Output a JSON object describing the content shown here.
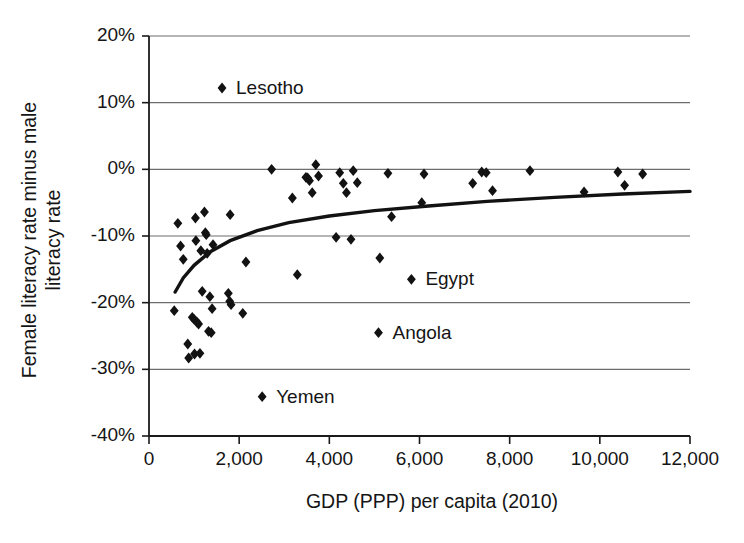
{
  "chart_data": {
    "type": "scatter",
    "title": "",
    "xlabel": "GDP (PPP) per capita (2010)",
    "ylabel_line1": "Female literacy rate minus male",
    "ylabel_line2": "literacy rate",
    "xlim": [
      0,
      12000
    ],
    "ylim": [
      -0.4,
      0.2
    ],
    "grid": "horizontal",
    "legend": "none",
    "xticks": [
      0,
      2000,
      4000,
      6000,
      8000,
      10000,
      12000
    ],
    "xticklabels": [
      "0",
      "2,000",
      "4,000",
      "6,000",
      "8,000",
      "10,000",
      "12,000"
    ],
    "yticks": [
      0.2,
      0.1,
      0.0,
      -0.1,
      -0.2,
      -0.3,
      -0.4
    ],
    "yticklabels": [
      "20%",
      "10%",
      "0%",
      "-10%",
      "-20%",
      "-30%",
      "-40%"
    ],
    "marker": "diamond",
    "marker_color": "#121212",
    "points": [
      {
        "x": 560,
        "y": -0.212
      },
      {
        "x": 640,
        "y": -0.081
      },
      {
        "x": 700,
        "y": -0.115
      },
      {
        "x": 760,
        "y": -0.135
      },
      {
        "x": 860,
        "y": -0.262
      },
      {
        "x": 880,
        "y": -0.283
      },
      {
        "x": 960,
        "y": -0.222
      },
      {
        "x": 1000,
        "y": -0.225
      },
      {
        "x": 1010,
        "y": -0.277
      },
      {
        "x": 1030,
        "y": -0.073
      },
      {
        "x": 1040,
        "y": -0.107
      },
      {
        "x": 1060,
        "y": -0.229
      },
      {
        "x": 1100,
        "y": -0.232
      },
      {
        "x": 1130,
        "y": -0.276
      },
      {
        "x": 1150,
        "y": -0.122
      },
      {
        "x": 1180,
        "y": -0.183
      },
      {
        "x": 1230,
        "y": -0.064
      },
      {
        "x": 1250,
        "y": -0.095
      },
      {
        "x": 1270,
        "y": -0.098
      },
      {
        "x": 1290,
        "y": -0.126
      },
      {
        "x": 1320,
        "y": -0.243
      },
      {
        "x": 1350,
        "y": -0.191
      },
      {
        "x": 1380,
        "y": -0.245
      },
      {
        "x": 1400,
        "y": -0.209
      },
      {
        "x": 1420,
        "y": -0.113
      },
      {
        "x": 1760,
        "y": -0.186
      },
      {
        "x": 1790,
        "y": -0.198
      },
      {
        "x": 1800,
        "y": -0.068
      },
      {
        "x": 1820,
        "y": -0.203
      },
      {
        "x": 2080,
        "y": -0.216
      },
      {
        "x": 2150,
        "y": -0.139
      },
      {
        "x": 2720,
        "y": 0.0
      },
      {
        "x": 3180,
        "y": -0.043
      },
      {
        "x": 3290,
        "y": -0.158
      },
      {
        "x": 3480,
        "y": -0.012
      },
      {
        "x": 3520,
        "y": -0.013
      },
      {
        "x": 3560,
        "y": -0.017
      },
      {
        "x": 3620,
        "y": -0.035
      },
      {
        "x": 3700,
        "y": 0.007
      },
      {
        "x": 3760,
        "y": -0.01
      },
      {
        "x": 4150,
        "y": -0.102
      },
      {
        "x": 4230,
        "y": -0.005
      },
      {
        "x": 4310,
        "y": -0.021
      },
      {
        "x": 4380,
        "y": -0.035
      },
      {
        "x": 4480,
        "y": -0.105
      },
      {
        "x": 4530,
        "y": -0.002
      },
      {
        "x": 4620,
        "y": -0.02
      },
      {
        "x": 5120,
        "y": -0.133
      },
      {
        "x": 5300,
        "y": -0.006
      },
      {
        "x": 5380,
        "y": -0.071
      },
      {
        "x": 6050,
        "y": -0.05
      },
      {
        "x": 6100,
        "y": -0.007
      },
      {
        "x": 7180,
        "y": -0.021
      },
      {
        "x": 7380,
        "y": -0.004
      },
      {
        "x": 7480,
        "y": -0.005
      },
      {
        "x": 7620,
        "y": -0.032
      },
      {
        "x": 8450,
        "y": -0.002
      },
      {
        "x": 9650,
        "y": -0.034
      },
      {
        "x": 10400,
        "y": -0.004
      },
      {
        "x": 10550,
        "y": -0.024
      },
      {
        "x": 10950,
        "y": -0.007
      }
    ],
    "labeled_points": [
      {
        "label": "Lesotho",
        "x": 1620,
        "y": 0.122
      },
      {
        "label": "Egypt",
        "x": 5820,
        "y": -0.165
      },
      {
        "label": "Angola",
        "x": 5090,
        "y": -0.245
      },
      {
        "label": "Yemen",
        "x": 2510,
        "y": -0.341
      }
    ],
    "trendline": {
      "description": "logarithmic fit",
      "points": [
        {
          "x": 580,
          "y": -0.184
        },
        {
          "x": 760,
          "y": -0.163
        },
        {
          "x": 1000,
          "y": -0.144
        },
        {
          "x": 1350,
          "y": -0.124
        },
        {
          "x": 1800,
          "y": -0.107
        },
        {
          "x": 2400,
          "y": -0.092
        },
        {
          "x": 3100,
          "y": -0.08
        },
        {
          "x": 4000,
          "y": -0.07
        },
        {
          "x": 5000,
          "y": -0.062
        },
        {
          "x": 6200,
          "y": -0.055
        },
        {
          "x": 7500,
          "y": -0.048
        },
        {
          "x": 9000,
          "y": -0.042
        },
        {
          "x": 10500,
          "y": -0.037
        },
        {
          "x": 12000,
          "y": -0.033
        }
      ]
    }
  }
}
